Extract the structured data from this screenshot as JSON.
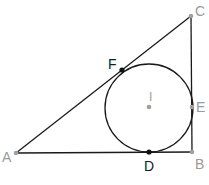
{
  "colors": {
    "line": "#1a1a1a",
    "label_gray": "#9a9a9a",
    "label_black": "#1a1a1a",
    "point_gray": "#a0a0a0",
    "point_black": "#111111",
    "background": "#ffffff"
  },
  "points": {
    "A": {
      "label": "A",
      "x": 16,
      "y": 153
    },
    "B": {
      "label": "B",
      "x": 192,
      "y": 152
    },
    "C": {
      "label": "C",
      "x": 191,
      "y": 16
    },
    "D": {
      "label": "D",
      "x": 149,
      "y": 152
    },
    "E": {
      "label": "E",
      "x": 192,
      "y": 107
    },
    "F": {
      "label": "F",
      "x": 122,
      "y": 70
    },
    "I": {
      "label": "I",
      "x": 149,
      "y": 107
    }
  },
  "incircle": {
    "center": "I",
    "radius": 44
  },
  "segments": [
    [
      "A",
      "B"
    ],
    [
      "B",
      "C"
    ],
    [
      "C",
      "A"
    ]
  ]
}
